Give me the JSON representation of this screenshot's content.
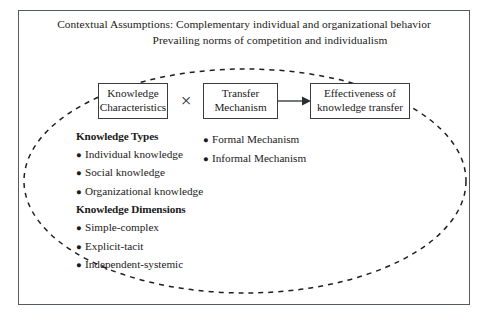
{
  "diagram": {
    "assumptions": {
      "line1": "Contextual Assumptions: Complementary individual and organizational behavior",
      "line2": "Prevailing norms of competition and individualism"
    },
    "boxes": {
      "knowledge_characteristics": {
        "line1": "Knowledge",
        "line2": "Characteristics"
      },
      "transfer_mechanism": {
        "line1": "Transfer",
        "line2": "Mechanism"
      },
      "effectiveness": {
        "line1": "Effectiveness of",
        "line2": "knowledge transfer"
      }
    },
    "operator": "×",
    "bullet_glyph": "●",
    "left_column": {
      "heading_types": "Knowledge Types",
      "types": [
        "Individual knowledge",
        "Social knowledge",
        "Organizational knowledge"
      ],
      "heading_dimensions": "Knowledge Dimensions",
      "dimensions": [
        "Simple-complex",
        "Explicit-tacit",
        "Independent-systemic"
      ]
    },
    "right_column": {
      "mechanisms": [
        "Formal Mechanism",
        "Informal Mechanism"
      ]
    },
    "colors": {
      "frame_border": "#555a5e",
      "box_border": "#3a3d40",
      "ellipse_stroke": "#1d1f21",
      "text": "#1a1a1a",
      "background": "#ffffff"
    }
  }
}
